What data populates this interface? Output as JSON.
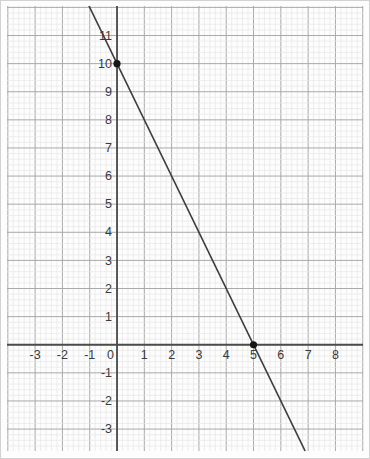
{
  "figure": {
    "name": "coordinate-plane-graph"
  },
  "chart_data": {
    "type": "line",
    "title": "",
    "xlabel": "",
    "ylabel": "",
    "series": [
      {
        "name": "plotted-line",
        "slope": -2,
        "intercept": 10,
        "points": [
          {
            "x": 0,
            "y": 10
          },
          {
            "x": 5,
            "y": 0
          }
        ]
      }
    ],
    "marked_points": [
      {
        "x": 0,
        "y": 10
      },
      {
        "x": 5,
        "y": 0
      }
    ],
    "x_axis": {
      "min": -4.03,
      "max": 9.01,
      "tick_values": [
        -3,
        -2,
        -1,
        0,
        1,
        2,
        3,
        4,
        5,
        6,
        7,
        8
      ],
      "tick_labels": [
        "-3",
        "-2",
        "-1",
        "0",
        "1",
        "2",
        "3",
        "4",
        "5",
        "6",
        "7",
        "8"
      ]
    },
    "y_axis": {
      "min": -3.78,
      "max": 12.05,
      "tick_values": [
        11,
        10,
        9,
        8,
        7,
        6,
        5,
        4,
        3,
        2,
        1,
        -1,
        -2,
        -3
      ],
      "tick_labels": [
        "11",
        "10",
        "9",
        "8",
        "7",
        "6",
        "5",
        "4",
        "3",
        "2",
        "1",
        "-1",
        "-2",
        "-3"
      ]
    },
    "grid": {
      "show": true,
      "minor_per_unit": 5
    },
    "legend": null
  },
  "style": {
    "background": "#fdfdfd",
    "minor_grid_color": "#e6e6e6",
    "major_grid_color": "#a9a9a9",
    "axis_color": "#4b4b4b",
    "line_color": "#3d3d3d",
    "point_color": "#161616",
    "label_color": "#3a3a3a"
  }
}
